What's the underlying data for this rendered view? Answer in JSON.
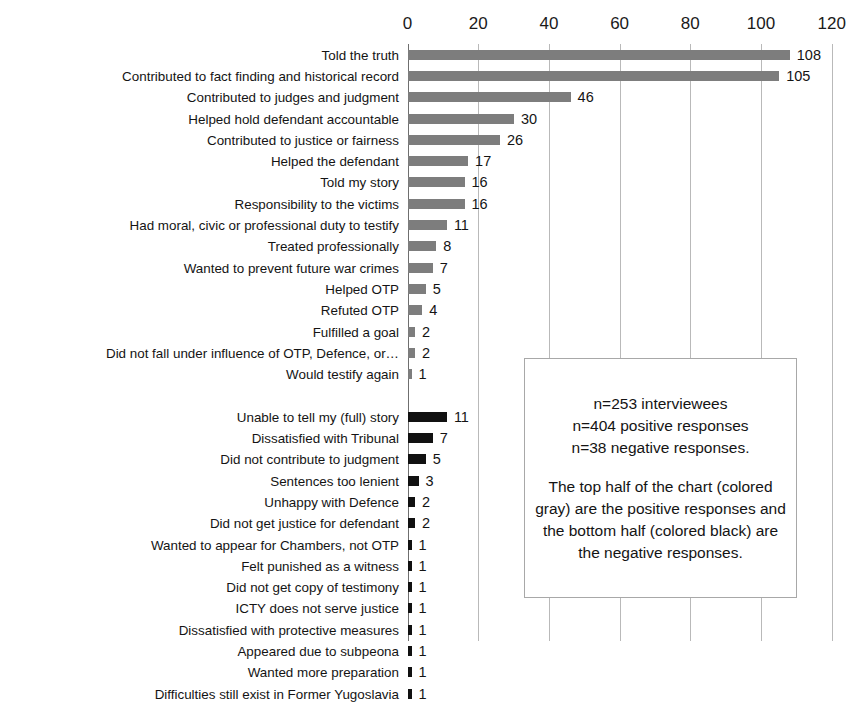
{
  "chart_data": {
    "type": "bar",
    "orientation": "horizontal",
    "title": "",
    "xlabel": "",
    "ylabel": "",
    "xlim": [
      0,
      120
    ],
    "xticks": [
      0,
      20,
      40,
      60,
      80,
      100,
      120
    ],
    "grid": true,
    "legend": false,
    "colors": {
      "positive": "#7d7d7d",
      "negative": "#111111"
    },
    "groups": [
      {
        "name": "positive responses",
        "color": "#7d7d7d",
        "categories": [
          "Told the truth",
          "Contributed to fact finding and historical record",
          "Contributed to judges and judgment",
          "Helped hold defendant accountable",
          "Contributed to justice or fairness",
          "Helped the defendant",
          "Told my story",
          "Responsibility to the victims",
          "Had moral, civic or professional duty to testify",
          "Treated professionally",
          "Wanted to prevent future war crimes",
          "Helped OTP",
          "Refuted OTP",
          "Fulfilled a goal",
          "Did not fall under influence of OTP, Defence, or…",
          "Would testify again"
        ],
        "values": [
          108,
          105,
          46,
          30,
          26,
          17,
          16,
          16,
          11,
          8,
          7,
          5,
          4,
          2,
          2,
          1
        ]
      },
      {
        "name": "negative responses",
        "color": "#111111",
        "categories": [
          "Unable to tell my (full) story",
          "Dissatisfied with Tribunal",
          "Did not contribute to judgment",
          "Sentences too lenient",
          "Unhappy with Defence",
          "Did not get justice for defendant",
          "Wanted to appear for Chambers, not OTP",
          "Felt punished as a witness",
          "Did not get copy of testimony",
          "ICTY does not serve justice",
          "Dissatisfied with protective measures",
          "Appeared due to subpeona",
          "Wanted more preparation",
          "Difficulties still exist in Former Yugoslavia"
        ],
        "values": [
          11,
          7,
          5,
          3,
          2,
          2,
          1,
          1,
          1,
          1,
          1,
          1,
          1,
          1
        ]
      }
    ],
    "annotation": {
      "line1": "n=253 interviewees",
      "line2": "n=404 positive responses",
      "line3": "n=38 negative responses.",
      "paragraph": "The top half of the chart (colored gray) are the positive responses and the bottom half (colored black) are the negative responses."
    }
  }
}
